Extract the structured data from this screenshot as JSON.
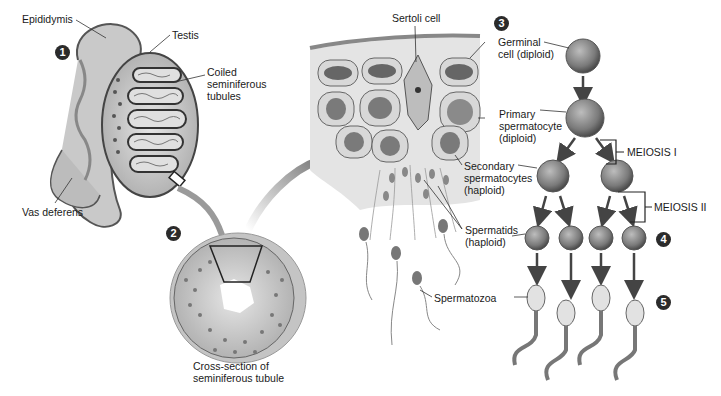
{
  "figure": {
    "colors": {
      "ink": "#1a1a1a",
      "badge": "#2b2b2b",
      "tissue": "#cfcfcf",
      "shadow": "#8a8a8a",
      "background": "#ffffff"
    }
  },
  "steps": [
    {
      "number": "1",
      "region": "testis-overview"
    },
    {
      "number": "2",
      "region": "tubule-cross-section"
    },
    {
      "number": "3",
      "region": "tubule-wall-detail"
    },
    {
      "number": "4",
      "region": "spermatids"
    },
    {
      "number": "5",
      "region": "spermatozoa"
    }
  ],
  "labels": {
    "epididymis": "Epididymis",
    "testis": "Testis",
    "coiled_line1": "Coiled",
    "coiled_line2": "seminiferous",
    "coiled_line3": "tubules",
    "vas_deferens": "Vas deferens",
    "cross_line1": "Cross-section of",
    "cross_line2": "seminiferous tubule",
    "sertoli": "Sertoli cell",
    "germinal_line1": "Germinal",
    "germinal_line2": "cell (diploid)",
    "primary_line1": "Primary",
    "primary_line2": "spermatocyte",
    "primary_line3": "(diploid)",
    "secondary_line1": "Secondary",
    "secondary_line2": "spermatocytes",
    "secondary_line3": "(haploid)",
    "spermatids_line1": "Spermatids",
    "spermatids_line2": "(haploid)",
    "spermatozoa": "Spermatozoa",
    "meiosis1": "MEIOSIS I",
    "meiosis2": "MEIOSIS II"
  }
}
